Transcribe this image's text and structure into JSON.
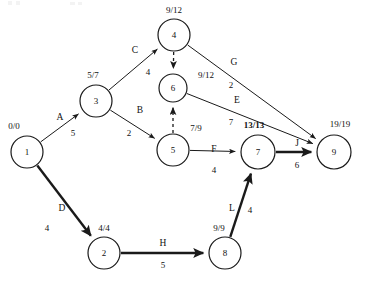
{
  "diagram": {
    "type": "project-network-cpm",
    "node_label_format": "earliest/latest",
    "nodes": [
      {
        "id": "1",
        "time": "0/0",
        "cx": 27,
        "cy": 152,
        "r": 16,
        "label_x": 14,
        "label_y": 129,
        "critical": false
      },
      {
        "id": "2",
        "time": "4/4",
        "cx": 104,
        "cy": 253,
        "r": 16,
        "label_x": 104,
        "label_y": 231,
        "critical": false
      },
      {
        "id": "3",
        "time": "5/7",
        "cx": 96,
        "cy": 101,
        "r": 16,
        "label_x": 93,
        "label_y": 78,
        "critical": false
      },
      {
        "id": "4",
        "time": "9/12",
        "cx": 174,
        "cy": 35,
        "r": 16,
        "label_x": 174,
        "label_y": 13,
        "critical": false
      },
      {
        "id": "5",
        "time": "7/9",
        "cx": 173,
        "cy": 150,
        "r": 16,
        "label_x": 196,
        "label_y": 131,
        "critical": false
      },
      {
        "id": "6",
        "time": "9/12",
        "cx": 173,
        "cy": 88,
        "r": 14,
        "label_x": 206,
        "label_y": 78,
        "critical": false
      },
      {
        "id": "7",
        "time": "13/13",
        "cx": 258,
        "cy": 152,
        "r": 17,
        "label_x": 254,
        "label_y": 128,
        "critical": true
      },
      {
        "id": "8",
        "time": "9/9",
        "cx": 225,
        "cy": 253,
        "r": 16,
        "label_x": 219,
        "label_y": 231,
        "critical": false
      },
      {
        "id": "9",
        "time": "19/19",
        "cx": 334,
        "cy": 152,
        "r": 17,
        "label_x": 340,
        "label_y": 127,
        "critical": false
      }
    ],
    "edges": [
      {
        "name": "A",
        "weight": "5",
        "from": "1",
        "to": "3",
        "critical": false,
        "dummy": false,
        "name_x": 60,
        "name_y": 120,
        "weight_x": 73,
        "weight_y": 136
      },
      {
        "name": "B",
        "weight": "2",
        "from": "3",
        "to": "5",
        "critical": false,
        "dummy": false,
        "name_x": 140,
        "name_y": 113,
        "weight_x": 129,
        "weight_y": 136
      },
      {
        "name": "C",
        "weight": "4",
        "from": "3",
        "to": "4",
        "critical": false,
        "dummy": false,
        "name_x": 135,
        "name_y": 53,
        "weight_x": 148,
        "weight_y": 75
      },
      {
        "name": "D",
        "weight": "4",
        "from": "1",
        "to": "2",
        "critical": true,
        "dummy": false,
        "name_x": 62,
        "name_y": 211,
        "weight_x": 47,
        "weight_y": 231
      },
      {
        "name": "E",
        "weight": "7",
        "from": "6",
        "to": "9",
        "critical": false,
        "dummy": false,
        "name_x": 237,
        "name_y": 103,
        "weight_x": 231,
        "weight_y": 125
      },
      {
        "name": "F",
        "weight": "4",
        "from": "5",
        "to": "7",
        "critical": false,
        "dummy": false,
        "name_x": 214,
        "name_y": 152,
        "weight_x": 214,
        "weight_y": 173
      },
      {
        "name": "G",
        "weight": "2",
        "from": "4",
        "to": "9",
        "critical": false,
        "dummy": false,
        "name_x": 234,
        "name_y": 65,
        "weight_x": 231,
        "weight_y": 88
      },
      {
        "name": "H",
        "weight": "5",
        "from": "2",
        "to": "8",
        "critical": true,
        "dummy": false,
        "name_x": 163,
        "name_y": 246,
        "weight_x": 163,
        "weight_y": 268
      },
      {
        "name": "J",
        "weight": "6",
        "from": "7",
        "to": "9",
        "critical": true,
        "dummy": false,
        "name_x": 297,
        "name_y": 146,
        "weight_x": 297,
        "weight_y": 168
      },
      {
        "name": "L",
        "weight": "4",
        "from": "8",
        "to": "7",
        "critical": true,
        "dummy": false,
        "name_x": 232,
        "name_y": 211,
        "weight_x": 250,
        "weight_y": 213
      },
      {
        "name": "",
        "weight": "",
        "from": "4",
        "to": "6",
        "critical": false,
        "dummy": true,
        "name_x": 0,
        "name_y": 0,
        "weight_x": 0,
        "weight_y": 0
      },
      {
        "name": "",
        "weight": "",
        "from": "5",
        "to": "6",
        "critical": false,
        "dummy": true,
        "name_x": 0,
        "name_y": 0,
        "weight_x": 0,
        "weight_y": 0
      }
    ]
  }
}
